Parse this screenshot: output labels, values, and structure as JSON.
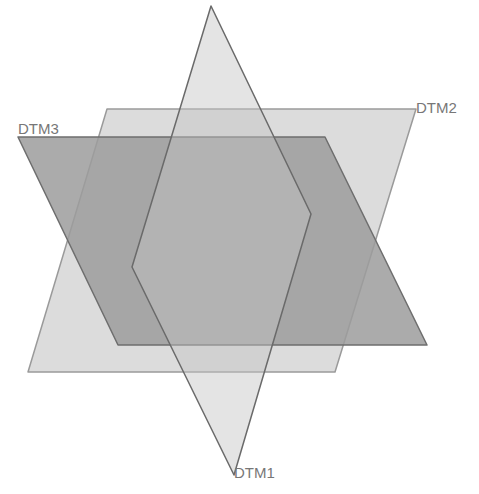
{
  "diagram": {
    "title": "",
    "background": "#ffffff",
    "planes": [
      {
        "id": "DTM2",
        "label": "DTM2",
        "fill": "#d6d6d6",
        "stroke": "#9a9a9a",
        "opacity": 0.85,
        "points": "107,109 416,109 335,372 28,372",
        "label_pos": {
          "x": 416,
          "y": 113
        }
      },
      {
        "id": "DTM3",
        "label": "DTM3",
        "fill": "#9c9c9c",
        "stroke": "#6e6e6e",
        "opacity": 0.85,
        "points": "18,137 325,137 427,345 118,345",
        "label_pos": {
          "x": 18,
          "y": 134
        }
      },
      {
        "id": "DTM1",
        "label": "DTM1",
        "fill": "#c4c4c4",
        "stroke": "#6a6a6a",
        "opacity": 0.45,
        "points": "211,6 311,214 234,475 132,267",
        "label_pos": {
          "x": 234,
          "y": 478
        }
      }
    ]
  }
}
